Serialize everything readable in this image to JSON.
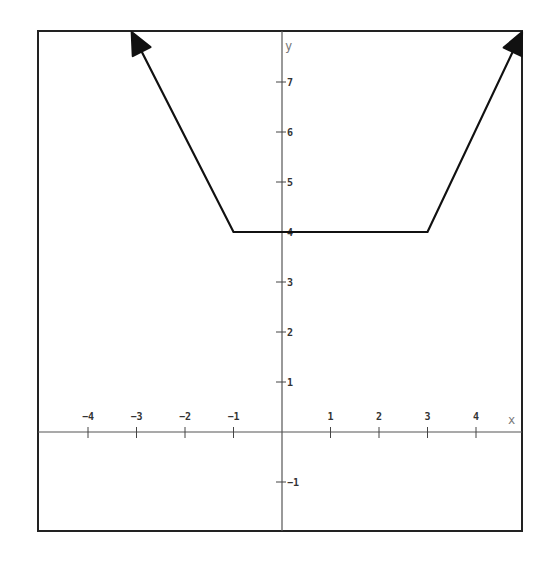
{
  "chart_data": {
    "type": "line",
    "title": "",
    "xlabel": "x",
    "ylabel": "y",
    "xlim": [
      -5.0,
      5.0
    ],
    "ylim": [
      -2.0,
      8.0
    ],
    "grid": false,
    "legend": null,
    "x_ticks": [
      -4,
      -3,
      -2,
      -1,
      1,
      2,
      3,
      4
    ],
    "x_tick_labels": [
      "−4",
      "−3",
      "−2",
      "−1",
      "1",
      "2",
      "3",
      "4"
    ],
    "y_ticks": [
      -1,
      1,
      2,
      3,
      4,
      5,
      6,
      7
    ],
    "y_tick_labels": [
      "−1",
      "1",
      "2",
      "3",
      "4",
      "5",
      "6",
      "7"
    ],
    "series": [
      {
        "name": "piecewise linear function",
        "x": [
          -3.1,
          -1,
          3,
          4.95
        ],
        "y": [
          8.0,
          4,
          4,
          8.0
        ],
        "start_arrow": true,
        "end_arrow": true,
        "color": "#111111"
      }
    ],
    "annotations": []
  },
  "colors": {
    "frame": "#222222",
    "axes": "#555555",
    "curve": "#111111",
    "background": "#ffffff"
  }
}
